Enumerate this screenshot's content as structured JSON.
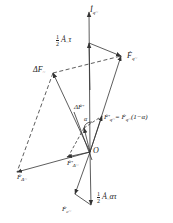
{
  "diagram": {
    "type": "phasor vector diagram",
    "origin_label": "O",
    "labels": {
      "i_q": {
        "main": "İ",
        "sub": "q~"
      },
      "half_a_tau": {
        "frac_num": "1",
        "frac_den": "2",
        "main": "Ȧ",
        "sub": "~",
        "suffix": "τ"
      },
      "f_q": {
        "main": "Ḟ",
        "sub": "q~"
      },
      "delta_f": {
        "main": "ΔF",
        "sub": "~"
      },
      "delta_f_prime": {
        "main": "ΔḞ'",
        "sub": ""
      },
      "f_q_prime_eq": {
        "main": "Ḟ'",
        "sub": "q~",
        "eq": "= Ḟ",
        "eq_sub": "q~",
        "suffix": "(1−α)"
      },
      "f_delta_prime": {
        "main": "Ḟ'",
        "sub": "Δ~"
      },
      "f_delta": {
        "main": "Ḟ",
        "sub": "Δ~"
      },
      "half_a_alpha_tau": {
        "frac_num": "1",
        "frac_den": "2",
        "main": "Ȧ",
        "sub": "~",
        "suffix": "ατ"
      },
      "f_c": {
        "main": "Ḟ",
        "sub": "c~"
      },
      "alpha": "α"
    },
    "colors": {
      "line": "#333333",
      "text": "#222222",
      "background": "#ffffff"
    }
  }
}
